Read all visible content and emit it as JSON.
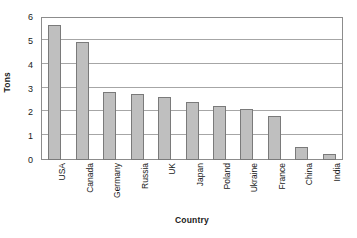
{
  "chart_data": {
    "type": "bar",
    "title": "",
    "xlabel": "Country",
    "ylabel": "Tons",
    "categories": [
      "USA",
      "Canada",
      "Germany",
      "Russia",
      "UK",
      "Japan",
      "Poland",
      "Ukraine",
      "France",
      "China",
      "India"
    ],
    "values": [
      5.65,
      4.95,
      2.85,
      2.75,
      2.65,
      2.45,
      2.25,
      2.15,
      1.85,
      0.55,
      0.25
    ],
    "ylim": [
      0,
      6
    ],
    "ytick_labels": [
      "0",
      "1",
      "2",
      "3",
      "4",
      "5",
      "6"
    ],
    "ytick_values": [
      0,
      1,
      2,
      3,
      4,
      5,
      6
    ],
    "grid": "horizontal",
    "legend": "none",
    "bar_color": "#bfbfbf",
    "bar_border_color": "#7a7a7a",
    "gridline_color": "#a6a6a6",
    "axis_color": "#8c8c8c",
    "background_color": "#ffffff",
    "series": [
      {
        "name": "Tons",
        "values": [
          5.65,
          4.95,
          2.85,
          2.75,
          2.65,
          2.45,
          2.25,
          2.15,
          1.85,
          0.55,
          0.25
        ]
      }
    ]
  }
}
